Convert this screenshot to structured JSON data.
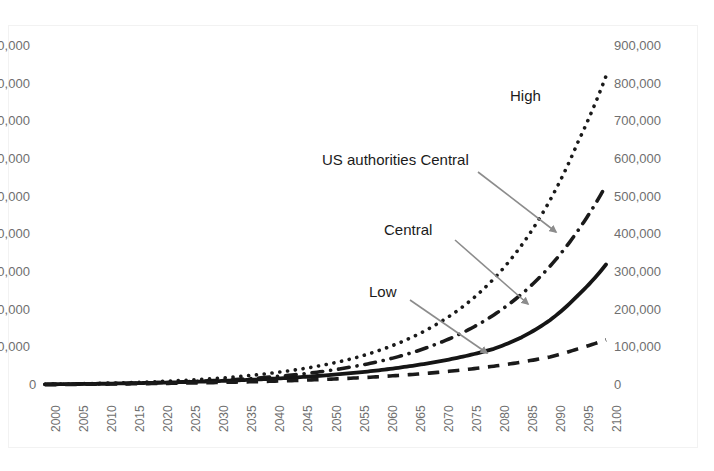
{
  "chart_data": {
    "type": "line",
    "title": "",
    "xlabel": "",
    "ylabel_left": "",
    "ylabel_right": "",
    "x": [
      2000,
      2005,
      2010,
      2015,
      2020,
      2025,
      2030,
      2035,
      2040,
      2045,
      2050,
      2055,
      2060,
      2065,
      2070,
      2075,
      2080,
      2085,
      2090,
      2095,
      2100
    ],
    "categories": [
      "2000",
      "2005",
      "2010",
      "2015",
      "2020",
      "2025",
      "2030",
      "2035",
      "2040",
      "2045",
      "2050",
      "2055",
      "2060",
      "2065",
      "2070",
      "2075",
      "2080",
      "2085",
      "2090",
      "2095",
      "2100"
    ],
    "xlim": [
      2000,
      2100
    ],
    "ylim_right": [
      0,
      900000
    ],
    "y_right_ticks": [
      "0",
      "100,000",
      "200,000",
      "300,000",
      "400,000",
      "500,000",
      "600,000",
      "700,000",
      "800,000",
      "900,000"
    ],
    "y_left_ticks_cropped": [
      "0",
      "0,000",
      "0,000",
      "0,000",
      "0,000",
      "0,000",
      "0,000",
      "0,000",
      "0,000",
      "0,000"
    ],
    "grid": false,
    "legend_position": "inline-annotations",
    "series": [
      {
        "name": "High",
        "style": "dotted",
        "color": "#1a1a1a",
        "values": [
          2000,
          3000,
          4500,
          6500,
          9000,
          12500,
          17000,
          23000,
          31000,
          41000,
          54000,
          71000,
          94000,
          124000,
          163000,
          214000,
          282000,
          372000,
          490000,
          645000,
          820000
        ]
      },
      {
        "name": "US authorities Central",
        "style": "dash-dot",
        "color": "#1a1a1a",
        "values": [
          1500,
          2200,
          3200,
          4500,
          6200,
          8500,
          11500,
          15500,
          21000,
          28000,
          37000,
          49000,
          64000,
          84000,
          110000,
          143000,
          186000,
          242000,
          315000,
          410000,
          530000
        ]
      },
      {
        "name": "Central",
        "style": "solid",
        "color": "#151515",
        "values": [
          1800,
          2500,
          3400,
          4600,
          6000,
          7800,
          10000,
          12800,
          16200,
          20400,
          25600,
          32000,
          40000,
          50000,
          62000,
          77000,
          96000,
          127000,
          172000,
          238000,
          320000
        ]
      },
      {
        "name": "Low",
        "style": "dashed",
        "color": "#1a1a1a",
        "values": [
          1200,
          1700,
          2300,
          3100,
          4000,
          5100,
          6400,
          8000,
          9900,
          12200,
          15000,
          18400,
          22500,
          27500,
          33500,
          41000,
          50000,
          61000,
          74500,
          96000,
          120000
        ]
      }
    ],
    "annotations": [
      {
        "label": "High",
        "x": 510,
        "y": 88,
        "has_leader": false
      },
      {
        "label": "US authorities Central",
        "x": 322,
        "y": 152,
        "has_leader": true,
        "leader": {
          "x1": 478,
          "y1": 172,
          "x2": 556,
          "y2": 232
        }
      },
      {
        "label": "Central",
        "x": 384,
        "y": 222,
        "has_leader": true,
        "leader": {
          "x1": 455,
          "y1": 240,
          "x2": 528,
          "y2": 304
        }
      },
      {
        "label": "Low",
        "x": 369,
        "y": 284,
        "has_leader": true,
        "leader": {
          "x1": 410,
          "y1": 300,
          "x2": 487,
          "y2": 353
        }
      }
    ],
    "leader_color": "#8c8c8c",
    "axis_text_color": "#6f6f6f"
  }
}
